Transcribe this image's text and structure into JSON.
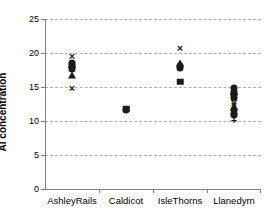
{
  "chart_data": {
    "type": "scatter",
    "title": "",
    "xlabel": "",
    "ylabel": "Al concentration",
    "categories": [
      "AshleyRails",
      "Caldicot",
      "IsleThorns",
      "Llanedyrn"
    ],
    "ylim": [
      0,
      25
    ],
    "yticks": [
      0,
      5,
      10,
      15,
      20,
      25
    ],
    "ytick_labels": [
      "0",
      "5",
      "10",
      "15",
      "20",
      "25"
    ],
    "grid": "horizontal-dashed",
    "legend": "none",
    "series": [
      {
        "name": "AshleyRails",
        "category": "AshleyRails",
        "points": [
          {
            "value": 19.5,
            "marker": "x"
          },
          {
            "value": 18.6,
            "marker": "circle"
          },
          {
            "value": 18.3,
            "marker": "circle"
          },
          {
            "value": 18.0,
            "marker": "diamond"
          },
          {
            "value": 17.7,
            "marker": "circle"
          },
          {
            "value": 16.7,
            "marker": "triangle"
          },
          {
            "value": 14.8,
            "marker": "x"
          }
        ]
      },
      {
        "name": "Caldicot",
        "category": "Caldicot",
        "points": [
          {
            "value": 11.8,
            "marker": "square"
          },
          {
            "value": 11.6,
            "marker": "circle"
          }
        ]
      },
      {
        "name": "IsleThorns",
        "category": "IsleThorns",
        "points": [
          {
            "value": 20.8,
            "marker": "x"
          },
          {
            "value": 18.5,
            "marker": "triangle"
          },
          {
            "value": 18.1,
            "marker": "circle"
          },
          {
            "value": 17.8,
            "marker": "circle"
          },
          {
            "value": 15.8,
            "marker": "square"
          }
        ]
      },
      {
        "name": "Llanedyrn",
        "category": "Llanedyrn",
        "points": [
          {
            "value": 14.8,
            "marker": "circle"
          },
          {
            "value": 14.3,
            "marker": "circle"
          },
          {
            "value": 14.0,
            "marker": "diamond"
          },
          {
            "value": 13.8,
            "marker": "circle"
          },
          {
            "value": 13.4,
            "marker": "circle"
          },
          {
            "value": 12.7,
            "marker": "x"
          },
          {
            "value": 12.4,
            "marker": "x"
          },
          {
            "value": 12.0,
            "marker": "triangle"
          },
          {
            "value": 11.6,
            "marker": "circle"
          },
          {
            "value": 11.1,
            "marker": "circle"
          },
          {
            "value": 10.9,
            "marker": "circle"
          },
          {
            "value": 10.1,
            "marker": "plus"
          }
        ]
      }
    ]
  }
}
